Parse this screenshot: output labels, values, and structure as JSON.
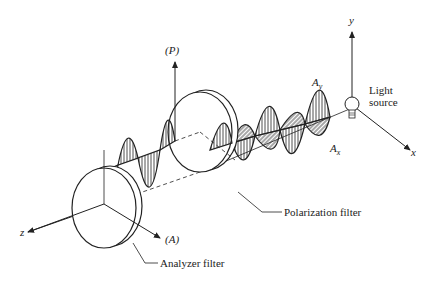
{
  "diagram": {
    "axes": {
      "y_label": "y",
      "x_label": "x",
      "z_label": "z"
    },
    "labels": {
      "light_source_line1": "Light",
      "light_source_line2": "source",
      "amplitude_y": "A",
      "amplitude_y_sub": "y",
      "amplitude_x": "A",
      "amplitude_x_sub": "x",
      "polarizer_axis": "(P)",
      "analyzer_axis": "(A)",
      "polarization_filter": "Polarization filter",
      "analyzer_filter": "Analyzer filter"
    },
    "colors": {
      "stroke": "#222222",
      "background": "#ffffff"
    }
  }
}
